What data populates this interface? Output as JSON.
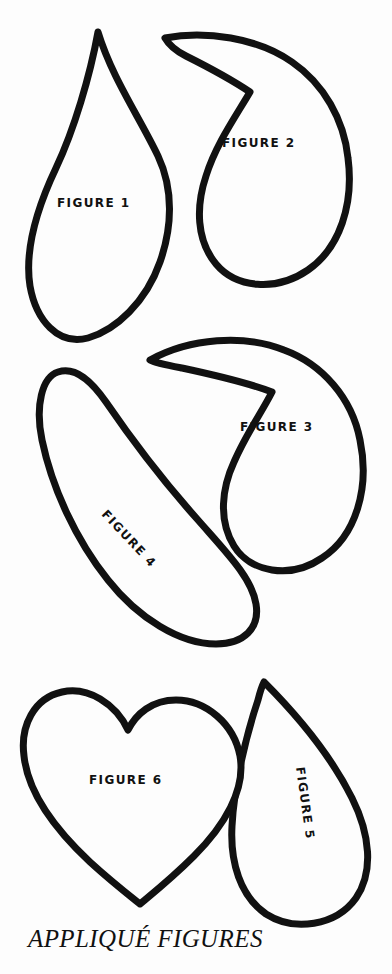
{
  "page": {
    "background_color": "#fdfdfd",
    "ink_color": "#111111",
    "width": 392,
    "height": 974
  },
  "caption": {
    "text": "APPLIQUÉ FIGURES"
  },
  "figures": [
    {
      "id": "figure-1",
      "label": "FIGURE 1",
      "shape_name": "teardrop",
      "description": "Pointed teardrop with apex at top and wide rounded bottom",
      "rotation_deg": 0
    },
    {
      "id": "figure-2",
      "label": "FIGURE 2",
      "shape_name": "comma-paisley",
      "description": "Comma / paisley shape with pointed tail at upper left curving into rounded bulb at lower right",
      "rotation_deg": 0
    },
    {
      "id": "figure-3",
      "label": "FIGURE 3",
      "shape_name": "comma-paisley",
      "description": "Comma shape with pointed tail at upper left and rounded bulb at lower right",
      "rotation_deg": 0
    },
    {
      "id": "figure-4",
      "label": "FIGURE 4",
      "shape_name": "curved-leaf",
      "description": "Long curved leaf with narrow pointed tip at upper left sweeping to a broad rounded end at lower right",
      "rotation_deg": 47
    },
    {
      "id": "figure-5",
      "label": "FIGURE 5",
      "shape_name": "flame-petal",
      "description": "Flame / petal shape with pointed tip at top and rounded base at bottom",
      "rotation_deg": 82
    },
    {
      "id": "figure-6",
      "label": "FIGURE 6",
      "shape_name": "heart",
      "description": "Symmetric heart with cleft at top centre and point at the bottom",
      "rotation_deg": 0
    }
  ]
}
